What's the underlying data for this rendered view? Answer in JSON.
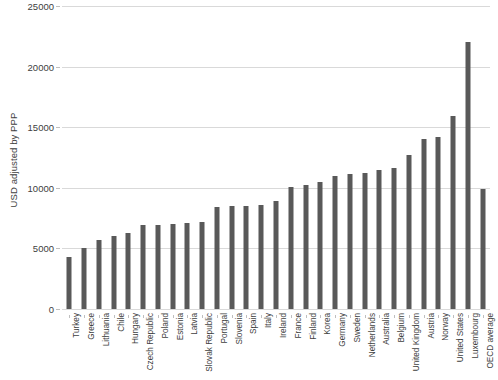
{
  "chart_data": {
    "type": "bar",
    "title": "",
    "subtitle": "",
    "xlabel": "",
    "ylabel": "USD adjusted by PPP",
    "ylim": [
      0,
      25000
    ],
    "ytick_step": 5000,
    "ytick_labels": [
      "25000",
      "20000",
      "15000",
      "10000",
      "5000",
      "0"
    ],
    "ytick_values": [
      25000,
      20000,
      15000,
      10000,
      5000,
      0
    ],
    "grid": true,
    "grid_axis": "y",
    "legend": false,
    "legend_position": "none",
    "bar_color": "#595959",
    "gridline_color": "#d9d9d9",
    "text_color": "#404040",
    "categories": [
      "Turkey",
      "Greece",
      "Lithuania",
      "Chile",
      "Hungary",
      "Czech Republic",
      "Poland",
      "Estonia",
      "Latvia",
      "Slovak Republic",
      "Portugal",
      "Slovenia",
      "Spain",
      "Italy",
      "Ireland",
      "France",
      "Finland",
      "Korea",
      "Germany",
      "Sweden",
      "Netherlands",
      "Australia",
      "Belgium",
      "United Kingdom",
      "Austria",
      "Norway",
      "United States",
      "Luxembourg",
      "OECD average"
    ],
    "values": [
      4300,
      5000,
      5700,
      6000,
      6300,
      6900,
      6900,
      7000,
      7100,
      7200,
      8400,
      8500,
      8500,
      8600,
      8900,
      10100,
      10200,
      10500,
      11000,
      11100,
      11200,
      11500,
      11600,
      12700,
      14000,
      14200,
      15900,
      22000,
      9900
    ]
  }
}
